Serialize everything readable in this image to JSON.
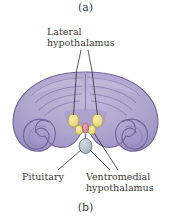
{
  "figure": {
    "panel_top_label": "(a)",
    "panel_bottom_label": "(b)"
  },
  "annotations": {
    "lateral_hypothalamus": "Lateral\nhypothalamus",
    "pituitary": "Pituitary",
    "ventromedial_hypothalamus": "Ventromedial\nhypothalamus"
  },
  "colors": {
    "background": "#ffffff",
    "brain_fill_light": "#b7aed4",
    "brain_fill_mid": "#a79ccb",
    "brain_fill_dark": "#9287bd",
    "brain_outline": "#6f6496",
    "nucleus_yellow": "#efe08a",
    "nucleus_yellow_outline": "#b5a43f",
    "nucleus_pink": "#d98f96",
    "nucleus_pink_outline": "#a9626a",
    "pituitary_fill": "#b9c4cc",
    "pituitary_outline": "#73808a",
    "leader_line": "#2e2e2e",
    "text": "#3a3a3a"
  }
}
